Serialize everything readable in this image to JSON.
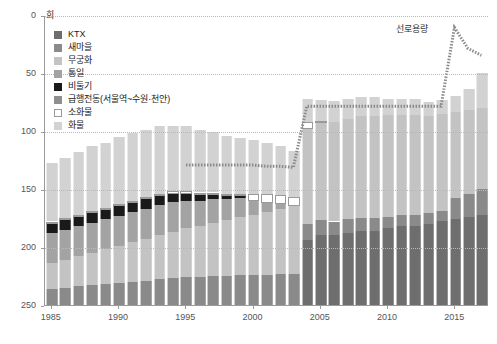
{
  "chart": {
    "unit_label": "회",
    "annotation": "선로용량"
  },
  "axes": {
    "y_ticks": [
      "250",
      "200",
      "150",
      "100",
      "50",
      "0"
    ],
    "x_ticks": [
      "1985",
      "1990",
      "1995",
      "2000",
      "2005",
      "2010",
      "2015"
    ]
  },
  "legend": {
    "items": [
      {
        "label": "KTX",
        "color": "#6e6e6e"
      },
      {
        "label": "새마을",
        "color": "#8a8a8a"
      },
      {
        "label": "무궁화",
        "color": "#c3c3c3"
      },
      {
        "label": "통일",
        "color": "#a3a3a3"
      },
      {
        "label": "비둘기",
        "color": "#1a1a1a"
      },
      {
        "label": "급행전동(서울역~수원·천안)",
        "color": "#8f8f8f"
      },
      {
        "label": "소화물",
        "color": "#ffffff"
      },
      {
        "label": "화물",
        "color": "#d2d2d2"
      }
    ]
  },
  "chart_data": {
    "type": "bar",
    "stacked": true,
    "title": "",
    "subtitle": "",
    "xlabel": "",
    "ylabel": "회",
    "ylim": [
      0,
      250
    ],
    "y_ticks": [
      0,
      50,
      100,
      150,
      200,
      250
    ],
    "grid": true,
    "legend_position": "top-left",
    "categories": [
      "1985",
      "1986",
      "1987",
      "1988",
      "1989",
      "1990",
      "1991",
      "1992",
      "1993",
      "1994",
      "1995",
      "1996",
      "1997",
      "1998",
      "1999",
      "2000",
      "2001",
      "2002",
      "2003",
      "2004",
      "2005",
      "2006",
      "2007",
      "2008",
      "2009",
      "2010",
      "2011",
      "2012",
      "2013",
      "2014",
      "2015",
      "2016",
      "2017"
    ],
    "series": [
      {
        "name": "KTX",
        "color": "#6e6e6e",
        "values": [
          0,
          0,
          0,
          0,
          0,
          0,
          0,
          0,
          0,
          0,
          0,
          0,
          0,
          0,
          0,
          0,
          0,
          0,
          0,
          56,
          60,
          60,
          62,
          64,
          64,
          66,
          68,
          68,
          70,
          72,
          74,
          76,
          78
        ]
      },
      {
        "name": "새마을",
        "color": "#8a8a8a",
        "values": [
          14,
          15,
          16,
          17,
          18,
          19,
          20,
          21,
          22,
          23,
          24,
          24,
          25,
          25,
          26,
          26,
          26,
          27,
          27,
          14,
          13,
          12,
          12,
          11,
          11,
          10,
          10,
          10,
          9,
          9,
          18,
          20,
          22
        ]
      },
      {
        "name": "무궁화",
        "color": "#c3c3c3",
        "values": [
          22,
          24,
          26,
          28,
          30,
          32,
          34,
          36,
          38,
          40,
          42,
          44,
          46,
          48,
          50,
          52,
          54,
          56,
          58,
          82,
          84,
          86,
          86,
          88,
          88,
          88,
          86,
          86,
          84,
          84,
          74,
          72,
          70
        ]
      },
      {
        "name": "통일",
        "color": "#a3a3a3",
        "values": [
          26,
          26,
          26,
          26,
          26,
          26,
          26,
          26,
          26,
          26,
          24,
          22,
          20,
          18,
          16,
          12,
          8,
          4,
          0,
          0,
          0,
          0,
          0,
          0,
          0,
          0,
          0,
          0,
          0,
          0,
          0,
          0,
          0
        ]
      },
      {
        "name": "비둘기",
        "color": "#1a1a1a",
        "values": [
          8,
          8,
          8,
          8,
          8,
          8,
          8,
          8,
          8,
          7,
          6,
          5,
          4,
          3,
          2,
          0,
          0,
          0,
          0,
          0,
          0,
          0,
          0,
          0,
          0,
          0,
          0,
          0,
          0,
          0,
          0,
          0,
          0
        ]
      },
      {
        "name": "급행전동(서울역~수원·천안)",
        "color": "#8f8f8f",
        "values": [
          0,
          0,
          0,
          0,
          0,
          0,
          0,
          0,
          0,
          0,
          0,
          0,
          0,
          0,
          0,
          0,
          0,
          0,
          0,
          0,
          0,
          0,
          0,
          0,
          0,
          0,
          0,
          0,
          0,
          0,
          0,
          0,
          0
        ]
      },
      {
        "name": "소화물",
        "color": "#ffffff",
        "values": [
          2,
          2,
          2,
          2,
          2,
          2,
          2,
          2,
          2,
          2,
          2,
          2,
          2,
          2,
          2,
          6,
          8,
          8,
          8,
          6,
          2,
          0,
          0,
          0,
          0,
          0,
          0,
          0,
          0,
          0,
          0,
          0,
          0
        ]
      },
      {
        "name": "화물",
        "color": "#d2d2d2",
        "values": [
          50,
          52,
          54,
          56,
          56,
          58,
          58,
          58,
          58,
          56,
          56,
          54,
          52,
          50,
          48,
          46,
          44,
          42,
          40,
          20,
          18,
          18,
          18,
          16,
          16,
          14,
          14,
          14,
          12,
          12,
          14,
          18,
          30
        ]
      }
    ],
    "overlay_line": {
      "name": "선로용량",
      "style": "dotted",
      "color": "#8a8a8a",
      "x": [
        "1985",
        "1986",
        "1987",
        "1988",
        "1989",
        "1990",
        "1991",
        "1992",
        "1993",
        "1994",
        "1995",
        "1996",
        "1997",
        "1998",
        "1999",
        "2000",
        "2001",
        "2002",
        "2003",
        "2004",
        "2005",
        "2006",
        "2007",
        "2008",
        "2009",
        "2010",
        "2011",
        "2012",
        "2013",
        "2014",
        "2015",
        "2016",
        "2017"
      ],
      "values": [
        null,
        null,
        null,
        null,
        null,
        null,
        null,
        null,
        null,
        null,
        121,
        121,
        121,
        121,
        121,
        121,
        120,
        120,
        119,
        172,
        172,
        172,
        172,
        172,
        172,
        172,
        172,
        172,
        172,
        172,
        240,
        222,
        216
      ]
    }
  }
}
